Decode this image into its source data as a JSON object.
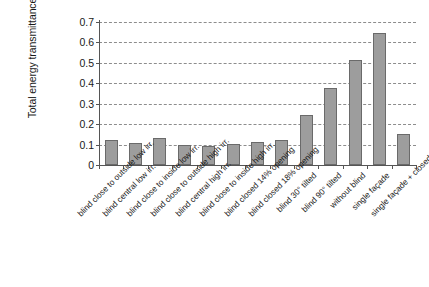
{
  "chart_data": {
    "type": "bar",
    "title": "",
    "xlabel": "",
    "ylabel": "Total energy transmittance",
    "ylim": [
      0,
      0.7
    ],
    "ytick_labels": [
      "0.7",
      "0.6",
      "0.5",
      "0.4",
      "0.3",
      "0.2",
      "0.1",
      "0"
    ],
    "ytick_values": [
      0.7,
      0.6,
      0.5,
      0.4,
      0.3,
      0.2,
      0.1,
      0
    ],
    "grid": "horizontal-dashed",
    "legend": "none",
    "bar_color": "#9d9d9d",
    "bar_edge_color": "#6a6a6a",
    "categories": [
      "blind close to outside low irr.",
      "blind central low irr.",
      "blind close to inside low irr.",
      "blind close to outside high irr.",
      "blind central high irr.",
      "blind close to inside high irr.",
      "blind closed 14% opening",
      "blind closed 18% opening",
      "blind 30° tilted",
      "blind 90° tilted",
      "without blind",
      "single façade",
      "single façade + closed blind"
    ],
    "values": [
      0.122,
      0.11,
      0.13,
      0.1,
      0.092,
      0.102,
      0.112,
      0.122,
      0.245,
      0.375,
      0.515,
      0.645,
      0.153
    ]
  }
}
